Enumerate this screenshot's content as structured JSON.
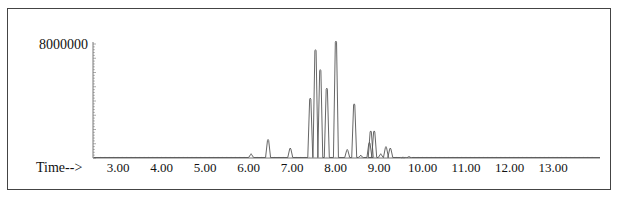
{
  "chart_data": {
    "type": "line",
    "title": "",
    "xlabel": "Time-->",
    "ylabel": "",
    "x_ticks": [
      3.0,
      4.0,
      5.0,
      6.0,
      7.0,
      8.0,
      9.0,
      10.0,
      11.0,
      12.0,
      13.0
    ],
    "x_tick_labels": [
      "3.00",
      "4.00",
      "5.00",
      "6.00",
      "7.00",
      "8.00",
      "9.00",
      "10.00",
      "11.00",
      "12.00",
      "13.00"
    ],
    "y_tick_labels": [
      "8000000"
    ],
    "xlim": [
      2.6,
      13.9
    ],
    "ylim": [
      0,
      8400000
    ],
    "grid": false,
    "legend": null,
    "series": [
      {
        "name": "TIC",
        "peaks": [
          {
            "rt": 6.06,
            "abundance": 300000
          },
          {
            "rt": 6.45,
            "abundance": 1300000
          },
          {
            "rt": 6.96,
            "abundance": 700000
          },
          {
            "rt": 7.42,
            "abundance": 4200000
          },
          {
            "rt": 7.54,
            "abundance": 7600000
          },
          {
            "rt": 7.65,
            "abundance": 6200000
          },
          {
            "rt": 7.8,
            "abundance": 4900000
          },
          {
            "rt": 8.01,
            "abundance": 8200000
          },
          {
            "rt": 8.27,
            "abundance": 600000
          },
          {
            "rt": 8.43,
            "abundance": 3800000
          },
          {
            "rt": 8.58,
            "abundance": 200000
          },
          {
            "rt": 8.78,
            "abundance": 1100000
          },
          {
            "rt": 8.81,
            "abundance": 1900000
          },
          {
            "rt": 8.89,
            "abundance": 1900000
          },
          {
            "rt": 9.04,
            "abundance": 300000
          },
          {
            "rt": 9.16,
            "abundance": 800000
          },
          {
            "rt": 9.26,
            "abundance": 700000
          },
          {
            "rt": 9.55,
            "abundance": 80000
          },
          {
            "rt": 9.69,
            "abundance": 120000
          }
        ]
      }
    ]
  },
  "axis": {
    "y_label_top": "8000000",
    "x_prefix": "Time-->"
  }
}
